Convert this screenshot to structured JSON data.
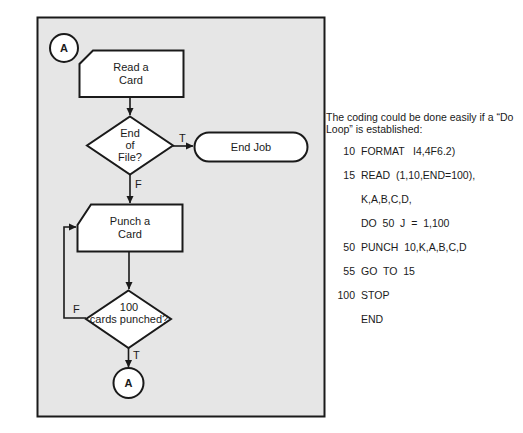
{
  "flowchart": {
    "connector_top": "A",
    "read_card": [
      "Read a",
      "Card"
    ],
    "end_of_file": [
      "End",
      "of",
      "File?"
    ],
    "eof_true_label": "T",
    "eof_false_label": "F",
    "end_job": "End Job",
    "punch_card": [
      "Punch a",
      "Card"
    ],
    "cards_check": [
      "100",
      "cards punched?"
    ],
    "check_false_label": "F",
    "check_true_label": "T",
    "connector_bottom": "A",
    "colors": {
      "panel_fill": "#e6e6e6",
      "stroke": "#1a1a1a",
      "node_fill": "#ffffff"
    }
  },
  "code": {
    "intro": "The coding could be done easily if a “Do Loop” is established:",
    "lines": [
      {
        "num": "10",
        "stmt": "FORMAT   I4,4F6.2)"
      },
      {
        "num": "15",
        "stmt": "READ  (1,10,END=100),"
      },
      {
        "num": "",
        "stmt": "K,A,B,C,D,"
      },
      {
        "num": "",
        "stmt": "DO  50  J  =  1,100"
      },
      {
        "num": "50",
        "stmt": "PUNCH  10,K,A,B,C,D"
      },
      {
        "num": "55",
        "stmt": "GO  TO  15"
      },
      {
        "num": "100",
        "stmt": "STOP"
      },
      {
        "num": "",
        "stmt": "END"
      }
    ]
  }
}
